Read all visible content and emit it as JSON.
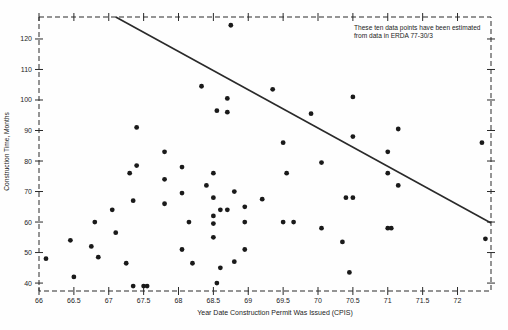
{
  "chart_data": {
    "type": "scatter",
    "title": "",
    "xlabel": "Year Date Construction Permit Was Issued (CPIS)",
    "ylabel": "Construction Time, Months",
    "xlim": [
      66,
      72.48
    ],
    "ylim": [
      37.4,
      127.2
    ],
    "x_ticks": [
      66,
      66.5,
      67,
      67.5,
      68,
      68.5,
      69,
      69.5,
      70,
      70.5,
      71,
      71.5,
      72
    ],
    "x_tick_labels": [
      "66",
      "66.5",
      "67",
      "67.5",
      "68",
      "68.5",
      "69",
      "69.5",
      "70",
      "70.5",
      "71",
      "71.5",
      "72"
    ],
    "y_ticks": [
      40,
      50,
      60,
      70,
      80,
      90,
      100,
      110,
      120
    ],
    "y_tick_labels": [
      "40",
      "50",
      "60",
      "70",
      "80",
      "90",
      "100",
      "110",
      "120"
    ],
    "grid": false,
    "legend": "none",
    "point_color": "#1a1a1a",
    "line_color": "#2a2a2a",
    "border_style": "dashed",
    "annotation": {
      "line1": "These ten data points have been estimated",
      "line2": "from data in ERDA 77-30/3"
    },
    "trend_line": {
      "x1": 67.1,
      "y1": 127.2,
      "x2": 72.48,
      "y2": 59.7
    },
    "points": [
      [
        66.1,
        48
      ],
      [
        66.45,
        54
      ],
      [
        66.5,
        42
      ],
      [
        66.75,
        52
      ],
      [
        66.8,
        60
      ],
      [
        66.85,
        48.5
      ],
      [
        67.05,
        64
      ],
      [
        67.1,
        56.5
      ],
      [
        67.25,
        46.5
      ],
      [
        67.3,
        76
      ],
      [
        67.35,
        67
      ],
      [
        67.35,
        39
      ],
      [
        67.4,
        91
      ],
      [
        67.4,
        78.5
      ],
      [
        67.5,
        39
      ],
      [
        67.55,
        39
      ],
      [
        67.8,
        83
      ],
      [
        67.8,
        74
      ],
      [
        67.8,
        66
      ],
      [
        68.05,
        78
      ],
      [
        68.05,
        69.5
      ],
      [
        68.05,
        51
      ],
      [
        68.15,
        60
      ],
      [
        68.2,
        46.5
      ],
      [
        68.33,
        104.5
      ],
      [
        68.4,
        72
      ],
      [
        68.5,
        76
      ],
      [
        68.5,
        68
      ],
      [
        68.5,
        62
      ],
      [
        68.5,
        59.5
      ],
      [
        68.5,
        55
      ],
      [
        68.55,
        96.5
      ],
      [
        68.55,
        40
      ],
      [
        68.6,
        64
      ],
      [
        68.6,
        45
      ],
      [
        68.7,
        100.5
      ],
      [
        68.7,
        96
      ],
      [
        68.7,
        64
      ],
      [
        68.75,
        124.5
      ],
      [
        68.8,
        70
      ],
      [
        68.8,
        47
      ],
      [
        68.95,
        65
      ],
      [
        68.95,
        60
      ],
      [
        68.95,
        51
      ],
      [
        69.2,
        67.5
      ],
      [
        69.35,
        103.5
      ],
      [
        69.5,
        86
      ],
      [
        69.5,
        60
      ],
      [
        69.55,
        76
      ],
      [
        69.65,
        60
      ],
      [
        69.9,
        95.5
      ],
      [
        70.05,
        79.5
      ],
      [
        70.05,
        58
      ],
      [
        70.35,
        53.5
      ],
      [
        70.4,
        68
      ],
      [
        70.45,
        43.5
      ],
      [
        70.5,
        101
      ],
      [
        70.5,
        88
      ],
      [
        70.5,
        68
      ],
      [
        71,
        83
      ],
      [
        71,
        76
      ],
      [
        71,
        58
      ],
      [
        71.05,
        58
      ],
      [
        71.15,
        90.5
      ],
      [
        71.15,
        72
      ],
      [
        72.35,
        86
      ],
      [
        72.4,
        54.5
      ]
    ]
  }
}
